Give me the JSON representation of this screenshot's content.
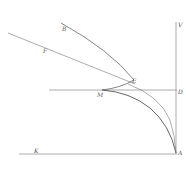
{
  "figure": {
    "type": "geometric-diagram",
    "stroke_color": "#777777",
    "curve_color": "#555555",
    "labels": [
      {
        "id": "B",
        "text": "B",
        "x": 62,
        "y": 26
      },
      {
        "id": "F",
        "text": "F",
        "x": 43,
        "y": 48
      },
      {
        "id": "E",
        "text": "E",
        "x": 132,
        "y": 78
      },
      {
        "id": "M",
        "text": "M",
        "x": 97,
        "y": 92
      },
      {
        "id": "V",
        "text": "V",
        "x": 178,
        "y": 22
      },
      {
        "id": "D",
        "text": "D",
        "x": 178,
        "y": 89
      },
      {
        "id": "K",
        "text": "K",
        "x": 34,
        "y": 148
      },
      {
        "id": "A",
        "text": "A",
        "x": 178,
        "y": 150
      }
    ]
  }
}
